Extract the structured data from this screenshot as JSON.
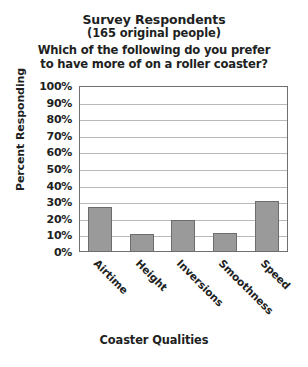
{
  "chart_data": {
    "type": "bar",
    "title": "Survey Respondents",
    "subtitle": "(165 original people)",
    "question_line1": "Which of the following do you prefer",
    "question_line2": "to have more of on a roller coaster?",
    "xlabel": "Coaster Qualities",
    "ylabel": "Percent Responding",
    "categories": [
      "Airtime",
      "Height",
      "Inversions",
      "Smoothness",
      "Speed"
    ],
    "values": [
      27,
      11,
      19,
      11.5,
      31
    ],
    "ylim": [
      0,
      100
    ],
    "ytick_step": 10,
    "ytick_labels": [
      "100%",
      "90%",
      "80%",
      "70%",
      "60%",
      "50%",
      "40%",
      "30%",
      "20%",
      "10%",
      "0%"
    ],
    "grid": true,
    "legend": "none",
    "bar_color": "#9a9a9a",
    "bar_border_color": "#6d6d6d",
    "frame_color": "#6f6f6f",
    "gridline_color": "#b9b9b9",
    "text_color": "#221f1f",
    "background": "#ffffff"
  }
}
